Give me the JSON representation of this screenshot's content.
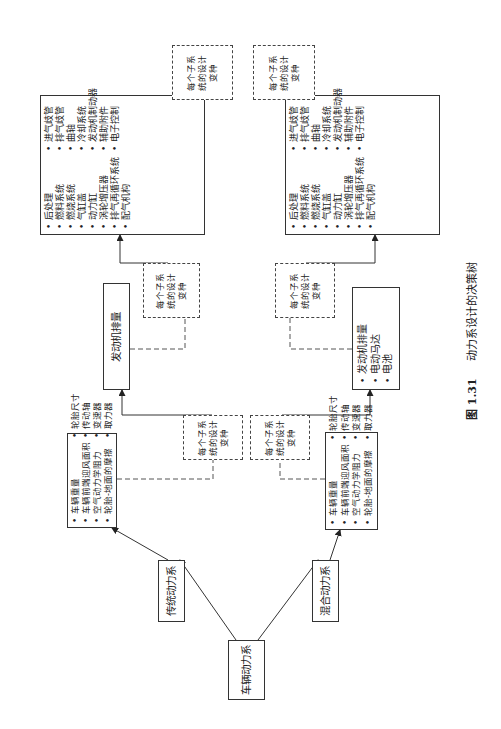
{
  "root": {
    "label": "车辆动力系"
  },
  "branches": [
    {
      "label": "传统动力系"
    },
    {
      "label": "混合动力系"
    }
  ],
  "vehicle_lists": [
    {
      "items": [
        "车辆重量",
        "车辆前端迎风面积",
        "空气动力学阻力",
        "轮胎-地面的摩擦",
        "轮胎尺寸",
        "传动轴",
        "变速器",
        "取力器"
      ]
    },
    {
      "items": [
        "车辆重量",
        "车辆前端迎风面积",
        "空气动力学阻力",
        "轮胎-地面的摩擦",
        "轮胎尺寸",
        "传动轴",
        "变速器",
        "取力器"
      ]
    }
  ],
  "variant_label": "每个子系\n统的设计\n变种",
  "engine_box": {
    "label": "发动机排量"
  },
  "hybrid_engine_list": {
    "items": [
      "发动机排量",
      "电动马达",
      "电池"
    ]
  },
  "subsystem_lists": [
    {
      "items": [
        "后处理",
        "燃料系统",
        "燃烧系统",
        "气缸盖",
        "动力缸",
        "涡轮增压器",
        "排气再循环系统",
        "配气机构",
        "进气歧管",
        "排气歧管",
        "曲轴",
        "冷却系统",
        "发动机制动器",
        "辅助附件",
        "电子控制"
      ]
    },
    {
      "items": [
        "后处理",
        "燃料系统",
        "燃烧系统",
        "气缸盖",
        "动力缸",
        "涡轮增压器",
        "排气再循环系统",
        "配气机构",
        "进气歧管",
        "排气歧管",
        "曲轴",
        "冷却系统",
        "发动机制动器",
        "辅助附件",
        "电子控制"
      ]
    }
  ],
  "caption": {
    "number": "图 1.31",
    "title": "动力系设计的决策树"
  }
}
